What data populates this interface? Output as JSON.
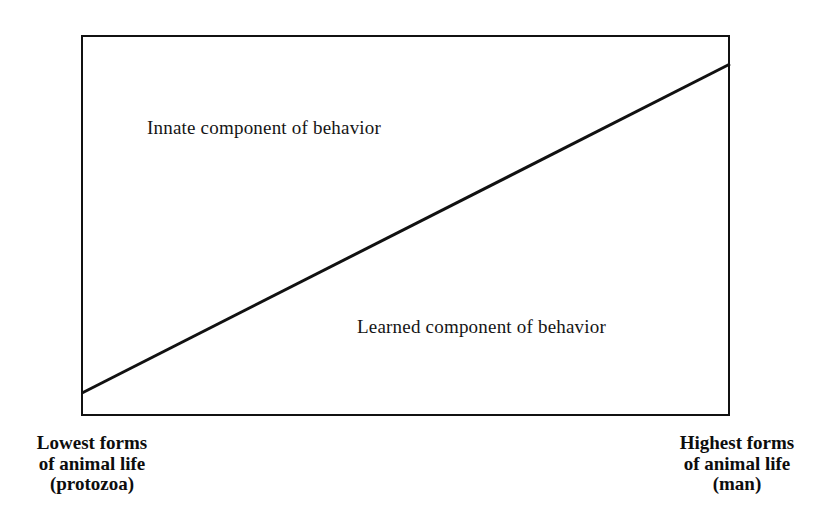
{
  "figure": {
    "background_color": "#ffffff",
    "line_color": "#111111",
    "width": 822,
    "height": 523
  },
  "plot": {
    "frame": {
      "x": 81,
      "y": 35,
      "width": 649,
      "height": 381
    },
    "divider": {
      "name": "innate-learned-boundary",
      "x1": 82,
      "y1": 393,
      "x2": 730,
      "y2": 64,
      "stroke_width": 3,
      "color": "#111111"
    },
    "regions": [
      {
        "id": "innate",
        "label": "Innate component of behavior"
      },
      {
        "id": "learned",
        "label": "Learned component of behavior"
      }
    ]
  },
  "captions": {
    "left": {
      "lines": [
        "Lowest forms",
        "of animal life",
        "(protozoa)"
      ]
    },
    "right": {
      "lines": [
        "Highest forms",
        "of animal life",
        "(man)"
      ]
    }
  },
  "chart_data": {
    "type": "area",
    "title": "",
    "subtitle": "",
    "xlabel": "",
    "ylabel": "",
    "grid": false,
    "legend": "none",
    "xlim": [
      0,
      1
    ],
    "ylim": [
      0,
      1
    ],
    "x_axis_endpoints": {
      "left": "Lowest forms of animal life (protozoa)",
      "right": "Highest forms of animal life (man)"
    },
    "x": [
      0,
      1
    ],
    "series": [
      {
        "name": "Learned component of behavior",
        "values": [
          0.01,
          0.92
        ],
        "note": "Region below the diagonal line; grows from near zero at the lowest animal forms to nearly the full range at man."
      },
      {
        "name": "Innate component of behavior",
        "values": [
          0.99,
          0.08
        ],
        "note": "Region above the diagonal line; shrinks from nearly the full range at the lowest animal forms to a small fraction at man."
      }
    ],
    "annotations": [
      {
        "text": "Innate component of behavior",
        "x": 0.1,
        "y": 0.79
      },
      {
        "text": "Learned component of behavior",
        "x": 0.43,
        "y": 0.26
      }
    ]
  }
}
